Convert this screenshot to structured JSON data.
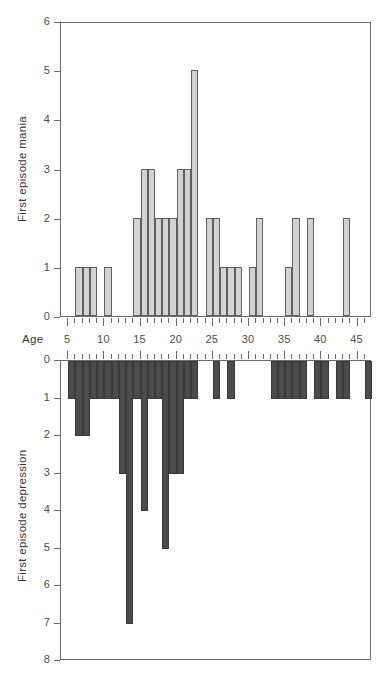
{
  "figure": {
    "width": 379,
    "height": 687,
    "background": "#ffffff"
  },
  "axis_titles": {
    "mania_y": "First episode mania",
    "depression_y": "First episode depression",
    "x": "Age"
  },
  "colors": {
    "mania_bar_fill": "#d2d2d2",
    "mania_bar_stroke": "#5f5f5f",
    "depression_bar_fill": "#4b4b4b",
    "depression_bar_stroke": "#3a3a3a",
    "axis": "#6b6b6b",
    "text": "#4d4d4d"
  },
  "chart_data": [
    {
      "type": "bar",
      "title": "",
      "xlabel": "Age",
      "ylabel": "First episode mania",
      "xlim": [
        4,
        47
      ],
      "ylim": [
        0,
        6
      ],
      "grid": false,
      "legend": false,
      "y_ticks": [
        0,
        1,
        2,
        3,
        4,
        5,
        6
      ],
      "x_ticks_major": [
        5,
        10,
        15,
        20,
        25,
        30,
        35,
        40,
        45
      ],
      "x_tick_labels": [
        "5",
        "10",
        "15",
        "20",
        "25",
        "30",
        "35",
        "40",
        "45"
      ],
      "bar_width_years": 1,
      "categories": [
        6,
        7,
        8,
        10,
        14,
        15,
        16,
        17,
        18,
        19,
        20,
        21,
        22,
        24,
        25,
        26,
        27,
        28,
        30,
        31,
        35,
        36,
        38,
        43
      ],
      "values": [
        1,
        1,
        1,
        1,
        2,
        3,
        3,
        2,
        2,
        2,
        3,
        3,
        5,
        2,
        2,
        1,
        1,
        1,
        1,
        2,
        1,
        2,
        2,
        2
      ]
    },
    {
      "type": "bar",
      "title": "",
      "xlabel": "Age",
      "ylabel": "First episode depression",
      "xlim": [
        4,
        47
      ],
      "ylim": [
        0,
        8
      ],
      "y_inverted": true,
      "grid": false,
      "legend": false,
      "y_ticks": [
        0,
        1,
        2,
        3,
        4,
        5,
        6,
        7,
        8
      ],
      "x_ticks_major": [
        5,
        10,
        15,
        20,
        25,
        30,
        35,
        40,
        45
      ],
      "x_tick_labels": [
        "5",
        "10",
        "15",
        "20",
        "25",
        "30",
        "35",
        "40",
        "45"
      ],
      "bar_width_years": 1,
      "categories": [
        5,
        6,
        7,
        8,
        9,
        10,
        11,
        12,
        13,
        14,
        15,
        16,
        17,
        18,
        19,
        20,
        21,
        22,
        25,
        27,
        33,
        34,
        35,
        36,
        37,
        39,
        40,
        42,
        43,
        46
      ],
      "values": [
        1,
        2,
        2,
        1,
        1,
        1,
        1,
        3,
        7,
        1,
        4,
        1,
        1,
        5,
        3,
        3,
        1,
        1,
        1,
        1,
        1,
        1,
        1,
        1,
        1,
        1,
        1,
        1,
        1,
        1
      ]
    }
  ]
}
